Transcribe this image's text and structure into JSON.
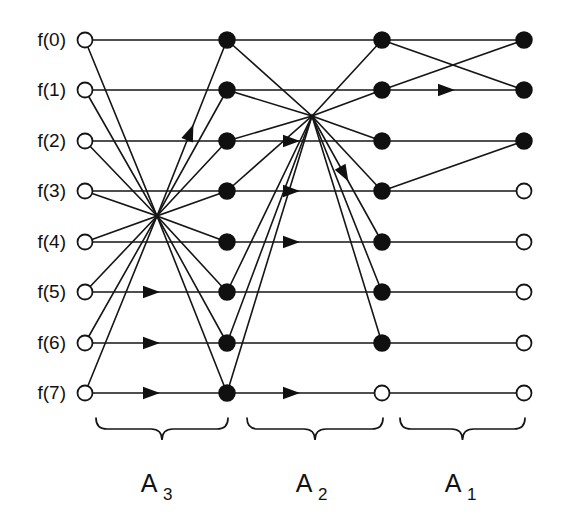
{
  "figure": {
    "type": "signal-flow-graph",
    "background_color": "#ffffff",
    "line_color": "#161616",
    "node_fill_color": "#101010",
    "node_open_color": "#ffffff"
  },
  "geometry": {
    "width": 566,
    "height": 516,
    "column_x": [
      85,
      227,
      382,
      524
    ],
    "row_y": [
      40,
      90,
      141,
      191,
      242,
      292,
      343,
      393
    ],
    "node_radius_open": 7.5,
    "node_radius_filled": 8.0
  },
  "row_labels": [
    {
      "text": "f(0)",
      "index": 0
    },
    {
      "text": "f(1)",
      "index": 1
    },
    {
      "text": "f(2)",
      "index": 2
    },
    {
      "text": "f(3)",
      "index": 3
    },
    {
      "text": "f(4)",
      "index": 4
    },
    {
      "text": "f(5)",
      "index": 5
    },
    {
      "text": "f(6)",
      "index": 6
    },
    {
      "text": "f(7)",
      "index": 7
    }
  ],
  "stage_labels": [
    {
      "main": "A",
      "sub": "3",
      "center_x": 157,
      "brace_left": 96,
      "brace_right": 228
    },
    {
      "main": "A",
      "sub": "2",
      "center_x": 312,
      "brace_left": 247,
      "brace_right": 383
    },
    {
      "main": "A",
      "sub": "1",
      "center_x": 461,
      "brace_left": 400,
      "brace_right": 525
    }
  ],
  "nodes": [
    {
      "col": 0,
      "row": 0,
      "state": "open"
    },
    {
      "col": 0,
      "row": 1,
      "state": "open"
    },
    {
      "col": 0,
      "row": 2,
      "state": "open"
    },
    {
      "col": 0,
      "row": 3,
      "state": "open"
    },
    {
      "col": 0,
      "row": 4,
      "state": "open"
    },
    {
      "col": 0,
      "row": 5,
      "state": "open"
    },
    {
      "col": 0,
      "row": 6,
      "state": "open"
    },
    {
      "col": 0,
      "row": 7,
      "state": "open"
    },
    {
      "col": 1,
      "row": 0,
      "state": "filled"
    },
    {
      "col": 1,
      "row": 1,
      "state": "filled"
    },
    {
      "col": 1,
      "row": 2,
      "state": "filled"
    },
    {
      "col": 1,
      "row": 3,
      "state": "filled"
    },
    {
      "col": 1,
      "row": 4,
      "state": "filled"
    },
    {
      "col": 1,
      "row": 5,
      "state": "filled"
    },
    {
      "col": 1,
      "row": 6,
      "state": "filled"
    },
    {
      "col": 1,
      "row": 7,
      "state": "filled"
    },
    {
      "col": 2,
      "row": 0,
      "state": "filled"
    },
    {
      "col": 2,
      "row": 1,
      "state": "filled"
    },
    {
      "col": 2,
      "row": 2,
      "state": "filled"
    },
    {
      "col": 2,
      "row": 3,
      "state": "filled"
    },
    {
      "col": 2,
      "row": 4,
      "state": "filled"
    },
    {
      "col": 2,
      "row": 5,
      "state": "filled"
    },
    {
      "col": 2,
      "row": 6,
      "state": "filled"
    },
    {
      "col": 2,
      "row": 7,
      "state": "open"
    },
    {
      "col": 3,
      "row": 0,
      "state": "filled"
    },
    {
      "col": 3,
      "row": 1,
      "state": "filled"
    },
    {
      "col": 3,
      "row": 2,
      "state": "filled"
    },
    {
      "col": 3,
      "row": 3,
      "state": "open"
    },
    {
      "col": 3,
      "row": 4,
      "state": "open"
    },
    {
      "col": 3,
      "row": 5,
      "state": "open"
    },
    {
      "col": 3,
      "row": 6,
      "state": "open"
    },
    {
      "col": 3,
      "row": 7,
      "state": "open"
    }
  ],
  "edges_straight": [
    {
      "stage": 3,
      "from_col": 0,
      "from_row": 0,
      "to_col": 1,
      "to_row": 0,
      "arrow": false
    },
    {
      "stage": 3,
      "from_col": 0,
      "from_row": 1,
      "to_col": 1,
      "to_row": 1,
      "arrow": false
    },
    {
      "stage": 3,
      "from_col": 0,
      "from_row": 2,
      "to_col": 1,
      "to_row": 2,
      "arrow": false
    },
    {
      "stage": 3,
      "from_col": 0,
      "from_row": 3,
      "to_col": 1,
      "to_row": 3,
      "arrow": false
    },
    {
      "stage": 3,
      "from_col": 0,
      "from_row": 4,
      "to_col": 1,
      "to_row": 4,
      "arrow": false
    },
    {
      "stage": 3,
      "from_col": 0,
      "from_row": 5,
      "to_col": 1,
      "to_row": 5,
      "arrow": true
    },
    {
      "stage": 3,
      "from_col": 0,
      "from_row": 6,
      "to_col": 1,
      "to_row": 6,
      "arrow": true
    },
    {
      "stage": 3,
      "from_col": 0,
      "from_row": 7,
      "to_col": 1,
      "to_row": 7,
      "arrow": true
    },
    {
      "stage": 3,
      "from_col": 0,
      "from_row": 0,
      "to_col": 1,
      "to_row": 4,
      "arrow": false
    },
    {
      "stage": 3,
      "from_col": 0,
      "from_row": 1,
      "to_col": 1,
      "to_row": 5,
      "arrow": false
    },
    {
      "stage": 3,
      "from_col": 0,
      "from_row": 2,
      "to_col": 1,
      "to_row": 6,
      "arrow": false
    },
    {
      "stage": 3,
      "from_col": 0,
      "from_row": 3,
      "to_col": 1,
      "to_row": 7,
      "arrow": false
    },
    {
      "stage": 3,
      "from_col": 0,
      "from_row": 4,
      "to_col": 1,
      "to_row": 0,
      "arrow": true
    },
    {
      "stage": 3,
      "from_col": 0,
      "from_row": 5,
      "to_col": 1,
      "to_row": 1,
      "arrow": false
    },
    {
      "stage": 3,
      "from_col": 0,
      "from_row": 6,
      "to_col": 1,
      "to_row": 2,
      "arrow": false
    },
    {
      "stage": 3,
      "from_col": 0,
      "from_row": 7,
      "to_col": 1,
      "to_row": 3,
      "arrow": false
    },
    {
      "stage": 2,
      "from_col": 1,
      "from_row": 0,
      "to_col": 2,
      "to_row": 0,
      "arrow": false
    },
    {
      "stage": 2,
      "from_col": 1,
      "from_row": 1,
      "to_col": 2,
      "to_row": 1,
      "arrow": false
    },
    {
      "stage": 2,
      "from_col": 1,
      "from_row": 2,
      "to_col": 2,
      "to_row": 2,
      "arrow": true
    },
    {
      "stage": 2,
      "from_col": 1,
      "from_row": 3,
      "to_col": 2,
      "to_row": 3,
      "arrow": true
    },
    {
      "stage": 2,
      "from_col": 1,
      "from_row": 4,
      "to_col": 2,
      "to_row": 4,
      "arrow": true
    },
    {
      "stage": 2,
      "from_col": 1,
      "from_row": 5,
      "to_col": 2,
      "to_row": 5,
      "arrow": false
    },
    {
      "stage": 2,
      "from_col": 1,
      "from_row": 6,
      "to_col": 2,
      "to_row": 6,
      "arrow": false
    },
    {
      "stage": 2,
      "from_col": 1,
      "from_row": 7,
      "to_col": 2,
      "to_row": 7,
      "arrow": true
    },
    {
      "stage": 2,
      "from_col": 1,
      "from_row": 0,
      "to_col": 2,
      "to_row": 2,
      "arrow": false
    },
    {
      "stage": 2,
      "from_col": 1,
      "from_row": 1,
      "to_col": 2,
      "to_row": 3,
      "arrow": false
    },
    {
      "stage": 2,
      "from_col": 1,
      "from_row": 2,
      "to_col": 2,
      "to_row": 0,
      "arrow": false
    },
    {
      "stage": 2,
      "from_col": 1,
      "from_row": 3,
      "to_col": 2,
      "to_row": 1,
      "arrow": false
    },
    {
      "stage": 2,
      "from_col": 1,
      "from_row": 5,
      "to_col": 2,
      "to_row": 4,
      "arrow": true
    },
    {
      "stage": 2,
      "from_col": 1,
      "from_row": 6,
      "to_col": 2,
      "to_row": 5,
      "arrow": false
    },
    {
      "stage": 2,
      "from_col": 1,
      "from_row": 7,
      "to_col": 2,
      "to_row": 6,
      "arrow": false
    },
    {
      "stage": 1,
      "from_col": 2,
      "from_row": 0,
      "to_col": 3,
      "to_row": 0,
      "arrow": false
    },
    {
      "stage": 1,
      "from_col": 2,
      "from_row": 1,
      "to_col": 3,
      "to_row": 1,
      "arrow": true
    },
    {
      "stage": 1,
      "from_col": 2,
      "from_row": 2,
      "to_col": 3,
      "to_row": 2,
      "arrow": false
    },
    {
      "stage": 1,
      "from_col": 2,
      "from_row": 3,
      "to_col": 3,
      "to_row": 3,
      "arrow": false
    },
    {
      "stage": 1,
      "from_col": 2,
      "from_row": 4,
      "to_col": 3,
      "to_row": 4,
      "arrow": false
    },
    {
      "stage": 1,
      "from_col": 2,
      "from_row": 5,
      "to_col": 3,
      "to_row": 5,
      "arrow": false
    },
    {
      "stage": 1,
      "from_col": 2,
      "from_row": 6,
      "to_col": 3,
      "to_row": 6,
      "arrow": false
    },
    {
      "stage": 1,
      "from_col": 2,
      "from_row": 7,
      "to_col": 3,
      "to_row": 7,
      "arrow": false
    },
    {
      "stage": 1,
      "from_col": 2,
      "from_row": 0,
      "to_col": 3,
      "to_row": 1,
      "arrow": false
    },
    {
      "stage": 1,
      "from_col": 2,
      "from_row": 1,
      "to_col": 3,
      "to_row": 0,
      "arrow": false
    },
    {
      "stage": 1,
      "from_col": 2,
      "from_row": 3,
      "to_col": 3,
      "to_row": 2,
      "arrow": false
    }
  ],
  "convergence_points": [
    {
      "stage": 3,
      "x": 157,
      "y": 216
    },
    {
      "stage": 2,
      "x": 312,
      "y": 116
    }
  ],
  "arrow_positions": {
    "stage3_horizontal_x": 160,
    "stage2_horizontal_x": 300,
    "stage1_horizontal_x": 455
  }
}
